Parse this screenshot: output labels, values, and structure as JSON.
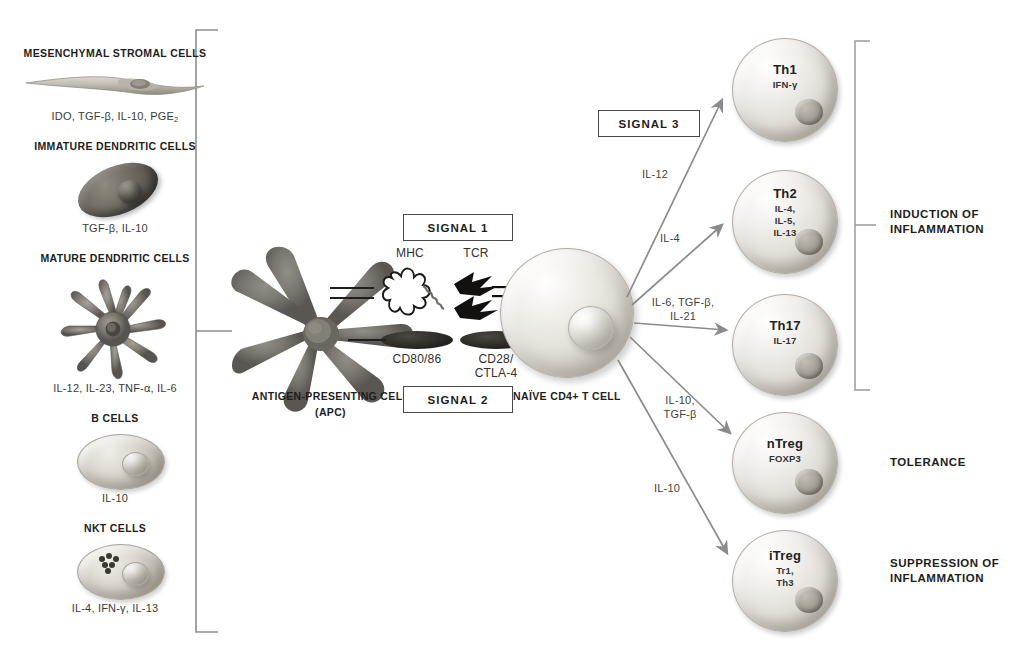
{
  "diagram": {
    "accent_dark": "#2b2b2b",
    "line_color": "#8a8a8a"
  },
  "left_panel": {
    "bracket_label": "regulatory-cell-sources",
    "cells": [
      {
        "name": "MESENCHYMAL STROMAL CELLS",
        "factors": "IDO, TGF-β, IL-10, PGE",
        "factors_sub": "2",
        "icon": "spindle-cell-icon"
      },
      {
        "name": "IMMATURE DENDRITIC CELLS",
        "factors": "TGF-β, IL-10",
        "factors_sub": "",
        "icon": "immature-dendritic-cell-icon"
      },
      {
        "name": "MATURE DENDRITIC CELLS",
        "factors": "IL-12, IL-23, TNF-α, IL-6",
        "factors_sub": "",
        "icon": "mature-dendritic-cell-icon"
      },
      {
        "name": "B CELLS",
        "factors": "IL-10",
        "factors_sub": "",
        "icon": "b-cell-icon"
      },
      {
        "name": "NKT CELLS",
        "factors": "IL-4, IFN-γ, IL-13",
        "factors_sub": "",
        "icon": "nkt-cell-icon"
      }
    ]
  },
  "center": {
    "apc_label_line1": "ANTIGEN-PRESENTING CELL",
    "apc_label_line2": "(APC)",
    "tcell_label": "NAÏVE CD4+ T CELL",
    "signal1": "SIGNAL 1",
    "signal2": "SIGNAL 2",
    "signal3": "SIGNAL 3",
    "molecules": {
      "mhc": "MHC",
      "tcr": "TCR",
      "cd80_86": "CD80/86",
      "cd28_line1": "CD28/",
      "cd28_line2": "CTLA-4"
    }
  },
  "arrows": [
    {
      "label": "IL-12",
      "target": "Th1"
    },
    {
      "label": "IL-4",
      "target": "Th2"
    },
    {
      "label_line1": "IL-6, TGF-β,",
      "label_line2": "IL-21",
      "target": "Th17"
    },
    {
      "label_line1": "IL-10,",
      "label_line2": "TGF-β",
      "target": "nTreg"
    },
    {
      "label": "IL-10",
      "target": "iTreg"
    }
  ],
  "effector_cells": [
    {
      "title": "Th1",
      "sub_lines": [
        "IFN-γ"
      ]
    },
    {
      "title": "Th2",
      "sub_lines": [
        "IL-4,",
        "IL-5,",
        "IL-13"
      ]
    },
    {
      "title": "Th17",
      "sub_lines": [
        "IL-17"
      ]
    },
    {
      "title": "nTreg",
      "sub_lines": [
        "FOXP3"
      ]
    },
    {
      "title": "iTreg",
      "sub_lines": [
        "Tr1,",
        "Th3"
      ]
    }
  ],
  "outcomes": [
    {
      "line1": "INDUCTION OF",
      "line2": "INFLAMMATION"
    },
    {
      "line1": "TOLERANCE",
      "line2": ""
    },
    {
      "line1": "SUPPRESSION OF",
      "line2": "INFLAMMATION"
    }
  ]
}
